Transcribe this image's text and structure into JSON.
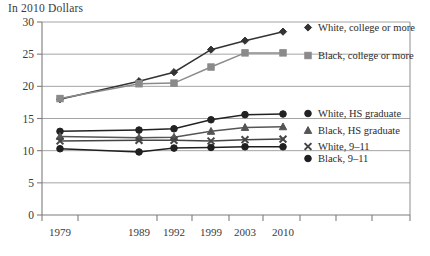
{
  "chart_data": {
    "type": "line",
    "title": "In 2010 Dollars",
    "xlabel": "",
    "ylabel": "",
    "ylim": [
      0,
      30
    ],
    "yticks": [
      0,
      5,
      10,
      15,
      20,
      25,
      30
    ],
    "grid": true,
    "legend_position": "right-inline",
    "categories": [
      "1979",
      "1989",
      "1992",
      "1999",
      "2003",
      "2010"
    ],
    "series": [
      {
        "name": "White, college or more",
        "marker": "diamond",
        "color": "#333333",
        "values": [
          18.0,
          20.8,
          22.2,
          25.7,
          27.1,
          28.5
        ]
      },
      {
        "name": "Black, college or more",
        "marker": "square",
        "color": "#8a8a8a",
        "values": [
          18.1,
          20.4,
          20.5,
          23.0,
          25.2,
          25.2
        ]
      },
      {
        "name": "White, HS graduate",
        "marker": "circle",
        "color": "#222222",
        "values": [
          13.0,
          13.2,
          13.4,
          14.8,
          15.6,
          15.7
        ]
      },
      {
        "name": "Black, HS graduate",
        "marker": "triangle",
        "color": "#555555",
        "values": [
          12.2,
          12.0,
          12.1,
          13.0,
          13.6,
          13.7
        ]
      },
      {
        "name": "White, 9–11",
        "marker": "x",
        "color": "#444444",
        "values": [
          11.5,
          11.6,
          11.6,
          11.5,
          11.7,
          11.8
        ]
      },
      {
        "name": "Black, 9–11",
        "marker": "circle",
        "color": "#1f1f1f",
        "values": [
          10.3,
          9.8,
          10.4,
          10.5,
          10.6,
          10.6
        ]
      }
    ],
    "legend_entries": [
      {
        "label": "White, college or more",
        "marker": "diamond",
        "color": "#333333",
        "x": 318,
        "y": 31
      },
      {
        "label": "Black, college or more",
        "marker": "square",
        "color": "#8a8a8a",
        "x": 318,
        "y": 59
      },
      {
        "label": "White, HS graduate",
        "marker": "circle",
        "color": "#222222",
        "x": 318,
        "y": 117
      },
      {
        "label": "Black, HS graduate",
        "marker": "triangle",
        "color": "#555555",
        "x": 318,
        "y": 134
      },
      {
        "label": "White, 9–11",
        "marker": "x",
        "color": "#444444",
        "x": 318,
        "y": 150
      },
      {
        "label": "Black, 9–11",
        "marker": "circle",
        "color": "#1f1f1f",
        "x": 318,
        "y": 162
      }
    ],
    "x_positions": [
      60,
      139,
      174,
      211,
      245,
      283
    ],
    "x_ticks": [
      42,
      78,
      157,
      192,
      229,
      263,
      300,
      336,
      372,
      410
    ]
  }
}
